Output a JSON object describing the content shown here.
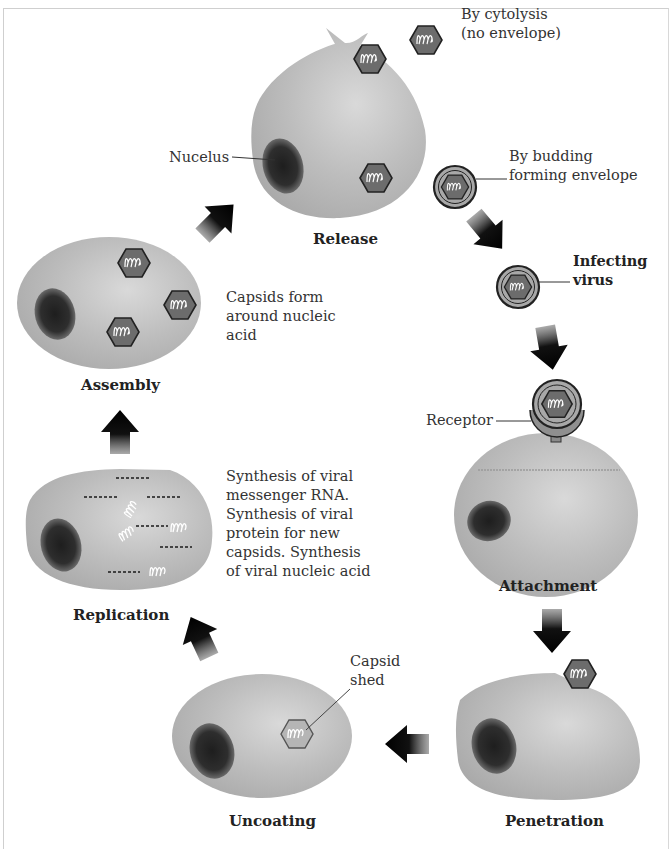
{
  "diagram": {
    "type": "viral replication cycle",
    "stages": [
      {
        "id": "release",
        "label": "Release"
      },
      {
        "id": "assembly",
        "label": "Assembly"
      },
      {
        "id": "replication",
        "label": "Replication"
      },
      {
        "id": "uncoating",
        "label": "Uncoating"
      },
      {
        "id": "penetration",
        "label": "Penetration"
      },
      {
        "id": "attachment",
        "label": "Attachment"
      }
    ],
    "labels": {
      "nucleus": "Nucelus",
      "cytolysis_line1": "By cytolysis",
      "cytolysis_line2": "(no envelope)",
      "budding_line1": "By budding",
      "budding_line2": "forming envelope",
      "infecting_line1": "Infecting",
      "infecting_line2": "virus",
      "receptor": "Receptor",
      "assembly_note_line1": "Capsids form",
      "assembly_note_line2": "around nucleic",
      "assembly_note_line3": "acid",
      "replication_note_line1": "Synthesis of viral",
      "replication_note_line2": "messenger RNA.",
      "replication_note_line3": "Synthesis of viral",
      "replication_note_line4": "protein for new",
      "replication_note_line5": "capsids. Synthesis",
      "replication_note_line6": "of viral nucleic acid",
      "capsid_shed_line1": "Capsid",
      "capsid_shed_line2": "shed"
    },
    "colors": {
      "cell": "#b8b8b8",
      "cell_highlight": "#d6d6d6",
      "nucleus": "#2e2e2e",
      "capsid": "#6e6e6e",
      "envelope": "#a9a9a9",
      "arrow": "#111111"
    }
  }
}
